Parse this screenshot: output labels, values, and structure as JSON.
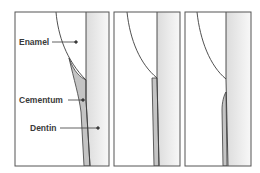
{
  "figure": {
    "panels": [
      {
        "id": "panel-1",
        "variant": "cementum-overlaps-enamel"
      },
      {
        "id": "panel-2",
        "variant": "edge-to-edge"
      },
      {
        "id": "panel-3",
        "variant": "gap-between-enamel-and-cementum"
      }
    ],
    "labels": {
      "enamel": "Enamel",
      "cementum": "Cementum",
      "dentin": "Dentin"
    },
    "colors": {
      "outline": "#3c3c3c",
      "enamel_fill": "#ffffff",
      "dentin_fill_start": "#dcdcdc",
      "dentin_fill_end": "#f8f8f8",
      "cementum_fill": "#c4c4c4",
      "label_text": "#3a3a3a"
    }
  }
}
